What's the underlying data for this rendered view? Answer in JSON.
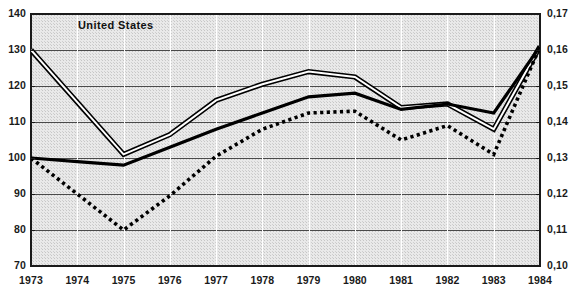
{
  "chart_data": {
    "type": "line",
    "title": "United States",
    "xlabel": "",
    "ylabel": "",
    "grid": true,
    "legend_position": "none",
    "x": [
      1973,
      1974,
      1975,
      1976,
      1977,
      1978,
      1979,
      1980,
      1981,
      1982,
      1983,
      1984
    ],
    "categories": [
      "1973",
      "1974",
      "1975",
      "1976",
      "1977",
      "1978",
      "1979",
      "1980",
      "1981",
      "1982",
      "1983",
      "1984"
    ],
    "left_axis": {
      "ticks": [
        "140",
        "130",
        "120",
        "110",
        "100",
        "90",
        "80",
        "70"
      ],
      "values": [
        140,
        130,
        120,
        110,
        100,
        90,
        80,
        70
      ],
      "ylim": [
        70,
        140
      ],
      "step": 10
    },
    "right_axis": {
      "ticks": [
        "0,17",
        "0,16",
        "0,15",
        "0,14",
        "0,13",
        "0,12",
        "0,11",
        "0,10"
      ],
      "values": [
        0.17,
        0.16,
        0.15,
        0.14,
        0.13,
        0.12,
        0.11,
        0.1
      ],
      "ylim": [
        0.1,
        0.17
      ],
      "step": 0.01
    },
    "series": [
      {
        "name": "series-double-line",
        "style": "double-line",
        "axis": "left",
        "values": [
          130.0,
          115.5,
          101.0,
          106.5,
          116.0,
          120.5,
          124.0,
          122.5,
          114.0,
          115.0,
          108.0,
          131.0
        ]
      },
      {
        "name": "series-solid-line",
        "style": "solid-thick",
        "axis": "left",
        "values": [
          100.0,
          99.0,
          98.0,
          103.0,
          108.0,
          112.5,
          117.0,
          118.0,
          113.5,
          115.0,
          112.5,
          131.0
        ]
      },
      {
        "name": "series-dotted-line",
        "style": "dotted",
        "axis": "left",
        "values": [
          100.0,
          90.0,
          80.0,
          89.5,
          100.5,
          108.0,
          112.5,
          113.0,
          105.0,
          109.0,
          101.0,
          131.0
        ]
      }
    ]
  },
  "colors": {
    "plot_background": "#dcdcdc",
    "horizontal_gridline": "#4a4a4a",
    "vertical_gridline": "#ffffff",
    "plot_border": "#1a1a1a",
    "series_line": "#000000",
    "series_double_center": "#ffffff",
    "label_text": "#1a1a1a"
  }
}
